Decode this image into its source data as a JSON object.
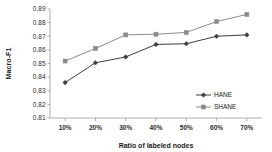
{
  "chart_data": {
    "type": "line",
    "title": "",
    "xlabel": "Ratio of labeled nodes",
    "ylabel": "Macro-F1",
    "categories": [
      "10%",
      "20%",
      "30%",
      "40%",
      "50%",
      "60%",
      "70%"
    ],
    "x": [
      10,
      20,
      30,
      40,
      50,
      60,
      70
    ],
    "ylim": [
      0.81,
      0.89
    ],
    "yticks": [
      "0.81",
      "0.82",
      "0.83",
      "0.84",
      "0.85",
      "0.86",
      "0.87",
      "0.88",
      "0.89"
    ],
    "ytick_values": [
      0.81,
      0.82,
      0.83,
      0.84,
      0.85,
      0.86,
      0.87,
      0.88,
      0.89
    ],
    "grid": false,
    "legend_position": "lower-right",
    "series": [
      {
        "name": "HANE",
        "color": "#3f3f3f",
        "marker": "diamond",
        "values": [
          0.836,
          0.8505,
          0.8548,
          0.864,
          0.8645,
          0.87,
          0.871
        ]
      },
      {
        "name": "SHANE",
        "color": "#8c8c8c",
        "marker": "square",
        "values": [
          0.8518,
          0.861,
          0.871,
          0.8715,
          0.8728,
          0.8808,
          0.886
        ]
      }
    ]
  },
  "axis": {
    "y_axis_name": "Macro-F1",
    "x_axis_name": "Ratio of labeled nodes"
  },
  "colors": {
    "hane": "#3f3f3f",
    "shane": "#8c8c8c",
    "axis": "#9a9a9a",
    "text": "#1a1a1a",
    "background": "#ffffff"
  }
}
